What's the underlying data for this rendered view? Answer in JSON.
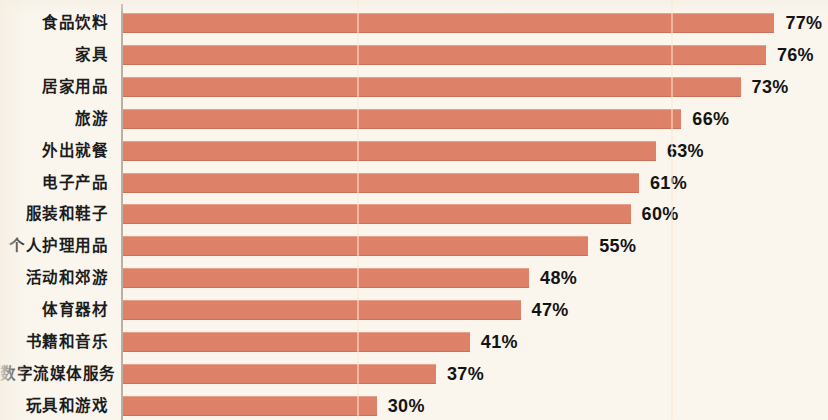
{
  "chart_data": {
    "type": "bar",
    "orientation": "horizontal",
    "title": "",
    "subtitle": "",
    "xlabel": "",
    "ylabel": "",
    "xlim": [
      0,
      77
    ],
    "grid": false,
    "legend": null,
    "value_suffix": "%",
    "categories": [
      "食品饮料",
      "家具",
      "居家用品",
      "旅游",
      "外出就餐",
      "电子产品",
      "服装和鞋子",
      "个人护理用品",
      "活动和郊游",
      "体育器材",
      "书籍和音乐",
      "数字流媒体服务",
      "玩具和游戏"
    ],
    "values": [
      77,
      76,
      73,
      66,
      63,
      61,
      60,
      55,
      48,
      47,
      41,
      37,
      30
    ],
    "value_labels": [
      "77%",
      "76%",
      "73%",
      "66%",
      "63%",
      "61%",
      "60%",
      "55%",
      "48%",
      "47%",
      "41%",
      "37%",
      "30%"
    ],
    "colors": {
      "bar": "#dd8268",
      "background": "#faf6ee",
      "axis": "#b9b0a2",
      "text": "#141414"
    }
  }
}
